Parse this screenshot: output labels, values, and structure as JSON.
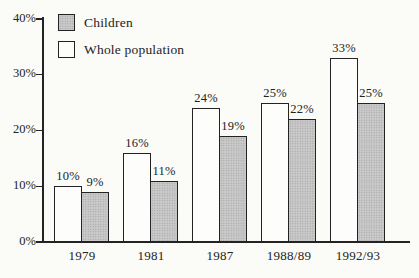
{
  "chart_data": {
    "type": "bar",
    "title": "",
    "categories": [
      "1979",
      "1981",
      "1987",
      "1988/89",
      "1992/93"
    ],
    "series": [
      {
        "name": "Whole population",
        "fill": "white",
        "values": [
          10,
          16,
          24,
          25,
          33
        ],
        "labels": [
          "10%",
          "16%",
          "24%",
          "25%",
          "33%"
        ]
      },
      {
        "name": "Children",
        "fill": "dotted-gray",
        "values": [
          9,
          11,
          19,
          22,
          25
        ],
        "labels": [
          "9%",
          "11%",
          "19%",
          "22%",
          "25%"
        ]
      }
    ],
    "ylim": [
      0,
      40
    ],
    "yticks": [
      0,
      10,
      20,
      30,
      40
    ],
    "ytick_labels": [
      "0%",
      "10%",
      "20%",
      "30%",
      "40%"
    ],
    "grid": false,
    "legend": {
      "position": "top-left",
      "entries": [
        {
          "label": "Children",
          "swatch": "dotted-gray"
        },
        {
          "label": "Whole population",
          "swatch": "white"
        }
      ]
    }
  },
  "colors": {
    "background": "#fbfbf8",
    "ink": "#232323",
    "bar_white_fill": "#fdfdfc",
    "bar_gray_fill": "#c9c9c9",
    "bar_gray_dot": "#9d9d9d"
  }
}
